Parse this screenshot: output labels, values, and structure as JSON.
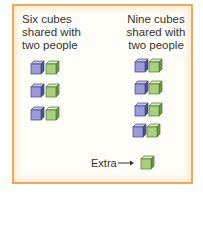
{
  "left_group": {
    "title_lines": [
      "Six cubes",
      "shared with",
      "two people"
    ],
    "rows": 3,
    "cubes_per_row": [
      "purple",
      "green"
    ]
  },
  "right_group": {
    "title_lines": [
      "Nine cubes",
      "shared with",
      "two people"
    ],
    "rows": 4,
    "cubes_per_row": [
      "purple",
      "green"
    ]
  },
  "extra": {
    "label": "Extra",
    "arrow": "→",
    "cube": "green"
  },
  "colors": {
    "border": "#f0a860",
    "purple_cube": "#9b9bd6",
    "green_cube": "#a8d080"
  }
}
